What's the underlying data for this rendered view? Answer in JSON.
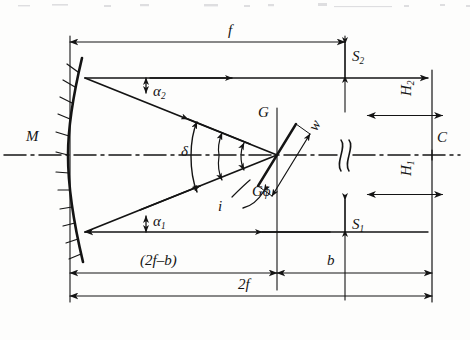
{
  "diagram": {
    "type": "optical-ray-diagram",
    "background": "#fdfdfc",
    "ink": "#141414"
  },
  "components": {
    "mirror_label": "M",
    "mirror_name": "concave-mirror",
    "grating_label": "G",
    "grating_blaze_label": "Gϕ",
    "grating_width_label": "w",
    "camera_label": "C"
  },
  "angles": [
    {
      "name": "alpha-2",
      "label": "α",
      "sub": "2"
    },
    {
      "name": "alpha-1",
      "label": "α",
      "sub": "1"
    },
    {
      "name": "delta",
      "label": "δ",
      "sub": ""
    },
    {
      "name": "incidence",
      "label": "i",
      "sub": ""
    }
  ],
  "dimensions": {
    "focal": "f",
    "double_focal": "2f",
    "offset_b": "b",
    "two_f_minus_b": "(2f–b)",
    "height_1": "H",
    "height_1_sub": "1",
    "height_2": "H",
    "height_2_sub": "2",
    "slit_1": "S",
    "slit_1_sub": "1",
    "slit_2": "S",
    "slit_2_sub": "2"
  },
  "geometry": {
    "mirror_axis_x": 70,
    "grating_x": 277,
    "camera_x": 432,
    "optical_axis_y": 155,
    "upper_ray_y": 78,
    "lower_ray_y": 232,
    "break_x": 345,
    "f_dim_y": 42,
    "two_f_dim_y": 296,
    "two_f_minus_b_dim_y": 273
  }
}
